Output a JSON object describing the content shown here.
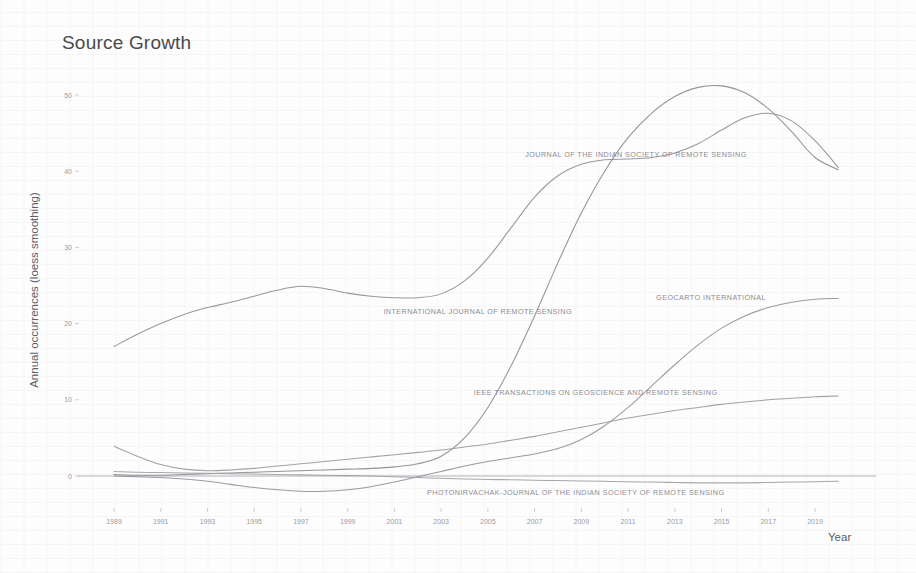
{
  "title": "Source Growth",
  "axis": {
    "x_title": "Year",
    "y_title": "Annual occurrences (loess smoothing)"
  },
  "chart_data": {
    "type": "line",
    "title": "Source Growth",
    "xlabel": "Year",
    "ylabel": "Annual occurrences (loess smoothing)",
    "xlim": [
      1989,
      2020
    ],
    "ylim": [
      -3,
      53
    ],
    "grid": false,
    "legend": "inline-labels",
    "x_ticks": [
      1989,
      1991,
      1993,
      1995,
      1997,
      1999,
      2001,
      2003,
      2005,
      2007,
      2009,
      2011,
      2013,
      2015,
      2017,
      2019
    ],
    "y_ticks": [
      0,
      10,
      20,
      30,
      40,
      50
    ],
    "x": [
      1989,
      1990,
      1991,
      1992,
      1993,
      1994,
      1995,
      1996,
      1997,
      1998,
      1999,
      2000,
      2001,
      2002,
      2003,
      2004,
      2005,
      2006,
      2007,
      2008,
      2009,
      2010,
      2011,
      2012,
      2013,
      2014,
      2015,
      2016,
      2017,
      2018,
      2019,
      2020
    ],
    "series": [
      {
        "name": "INTERNATIONAL JOURNAL OF REMOTE SENSING",
        "color": "#8f8f95",
        "label_x": 2008.6,
        "label_y": 21.2,
        "label_anchor": "end",
        "values": [
          17.0,
          18.6,
          20.0,
          21.2,
          22.1,
          22.8,
          23.6,
          24.4,
          24.9,
          24.6,
          24.0,
          23.6,
          23.4,
          23.4,
          23.9,
          25.6,
          28.6,
          32.6,
          36.6,
          39.4,
          40.9,
          41.5,
          41.6,
          41.8,
          42.4,
          43.6,
          45.4,
          47.0,
          47.6,
          46.6,
          44.0,
          40.5
        ]
      },
      {
        "name": "JOURNAL OF THE INDIAN SOCIETY OF REMOTE SENSING",
        "color": "#8a8a90",
        "label_x": 2006.6,
        "label_y": 41.8,
        "label_anchor": "start",
        "values": [
          0.2,
          0.1,
          0.1,
          0.2,
          0.3,
          0.4,
          0.5,
          0.6,
          0.7,
          0.8,
          0.9,
          1.0,
          1.2,
          1.6,
          2.6,
          5.0,
          9.0,
          14.5,
          21.0,
          28.0,
          34.5,
          40.0,
          44.4,
          47.6,
          49.8,
          51.0,
          51.2,
          50.3,
          48.2,
          45.2,
          41.8,
          40.2
        ]
      },
      {
        "name": "GEOCARTO INTERNATIONAL",
        "color": "#91919a",
        "label_x": 2012.2,
        "label_y": 23.1,
        "label_anchor": "start",
        "values": [
          0.0,
          -0.1,
          -0.2,
          -0.4,
          -0.7,
          -1.1,
          -1.5,
          -1.8,
          -2.0,
          -2.0,
          -1.8,
          -1.4,
          -0.8,
          -0.1,
          0.6,
          1.3,
          1.9,
          2.4,
          2.9,
          3.6,
          4.8,
          6.6,
          9.0,
          11.8,
          14.6,
          17.2,
          19.4,
          21.0,
          22.1,
          22.8,
          23.2,
          23.3
        ]
      },
      {
        "name": "IEEE TRANSACTIONS ON GEOSCIENCE AND REMOTE SENSING",
        "color": "#9a9aa1",
        "label_x": 2004.4,
        "label_y": 10.6,
        "label_anchor": "start",
        "values": [
          3.9,
          2.6,
          1.5,
          0.9,
          0.7,
          0.8,
          1.0,
          1.3,
          1.6,
          1.9,
          2.2,
          2.5,
          2.8,
          3.1,
          3.4,
          3.8,
          4.2,
          4.7,
          5.2,
          5.8,
          6.4,
          7.0,
          7.6,
          8.1,
          8.6,
          9.0,
          9.4,
          9.7,
          10.0,
          10.2,
          10.4,
          10.5
        ]
      },
      {
        "name": "PHOTONIRVACHAK-JOURNAL OF THE INDIAN SOCIETY OF REMOTE SENSING",
        "color": "#a0a0a7",
        "label_x": 2002.4,
        "label_y": -2.5,
        "label_anchor": "start",
        "values": [
          0.6,
          0.5,
          0.45,
          0.4,
          0.35,
          0.3,
          0.25,
          0.2,
          0.15,
          0.1,
          0.05,
          0.0,
          -0.1,
          -0.2,
          -0.3,
          -0.4,
          -0.45,
          -0.5,
          -0.55,
          -0.6,
          -0.65,
          -0.7,
          -0.75,
          -0.8,
          -0.85,
          -0.9,
          -0.9,
          -0.9,
          -0.85,
          -0.8,
          -0.75,
          -0.7
        ]
      }
    ],
    "baseline": {
      "y": 0,
      "color": "#9d9da4"
    }
  }
}
